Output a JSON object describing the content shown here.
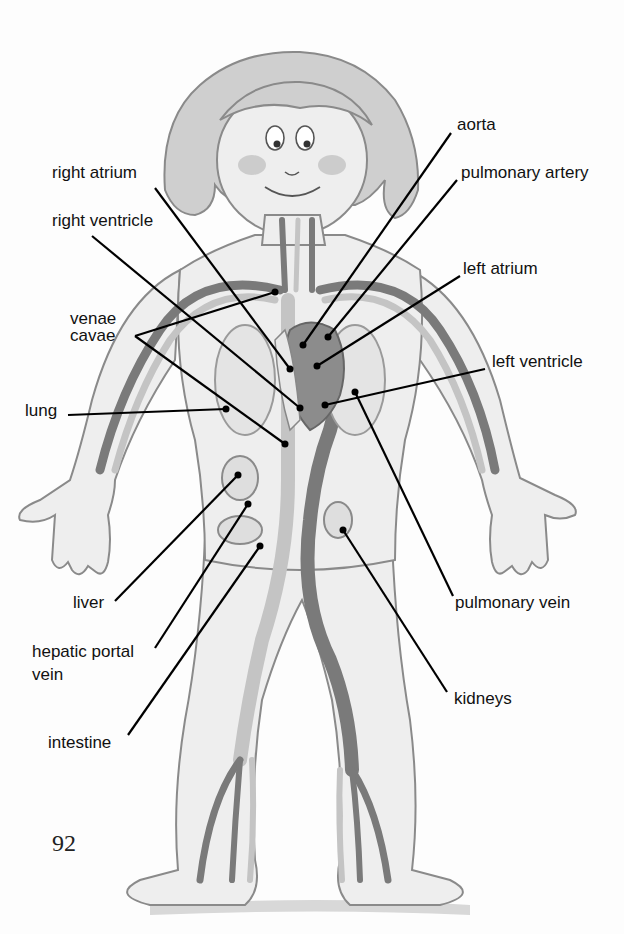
{
  "diagram": {
    "page_number": "92",
    "labels": {
      "aorta": "aorta",
      "pulmonary_artery": "pulmonary artery",
      "right_atrium": "right atrium",
      "right_ventricle": "right ventricle",
      "left_atrium": "left atrium",
      "venae_cavae_line1": "venae",
      "venae_cavae_line2": "cavae",
      "left_ventricle": "left ventricle",
      "lung": "lung",
      "liver": "liver",
      "hepatic_portal_vein_line1": "hepatic portal",
      "hepatic_portal_vein_line2": "vein",
      "intestine": "intestine",
      "pulmonary_vein": "pulmonary vein",
      "kidneys": "kidneys"
    },
    "colors": {
      "ink": "#111111",
      "outline": "#8a8a8a",
      "skin": "#eeeeee",
      "vessel_dark": "#7a7a7a",
      "vessel_light": "#c4c4c4",
      "heart": "#8c8c8c"
    }
  }
}
